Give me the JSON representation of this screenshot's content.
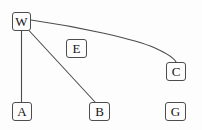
{
  "diagram": {
    "background_color": "#fdfdfd",
    "node_border_color": "#4d4d4d",
    "node_fill_color": "#fdfdfd",
    "edge_color": "#4d4d4d",
    "label_color": "#161616",
    "nodes": [
      {
        "id": "W",
        "label": "W",
        "x": 12,
        "y": 12,
        "width": 19,
        "height": 19
      },
      {
        "id": "E",
        "label": "E",
        "x": 66,
        "y": 39,
        "width": 21,
        "height": 19
      },
      {
        "id": "C",
        "label": "C",
        "x": 166,
        "y": 62,
        "width": 20,
        "height": 19
      },
      {
        "id": "A",
        "label": "A",
        "x": 12,
        "y": 102,
        "width": 20,
        "height": 19
      },
      {
        "id": "B",
        "label": "B",
        "x": 89,
        "y": 102,
        "width": 21,
        "height": 19
      },
      {
        "id": "G",
        "label": "G",
        "x": 165,
        "y": 102,
        "width": 21,
        "height": 19
      }
    ],
    "edges": [
      {
        "from": "W",
        "to": "A",
        "shape": "straight",
        "path": "M 21.5 31 L 21.5 102"
      },
      {
        "from": "W",
        "to": "B",
        "shape": "straight",
        "path": "M 29 30.5 L 95 102"
      },
      {
        "from": "W",
        "to": "C",
        "shape": "curved",
        "path": "M 31 20 C 80 27, 135 39, 155 48 C 168 54, 174 58, 176 62"
      }
    ]
  }
}
